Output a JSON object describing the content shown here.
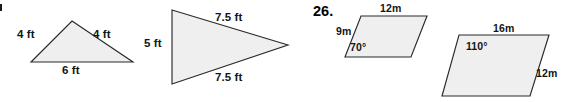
{
  "page": {
    "kind": "geometry-worksheet-excerpt",
    "width": 564,
    "height": 102,
    "background": "#ffffff",
    "shape_fill": "#efefef",
    "shape_stroke": "#2a2a2a"
  },
  "question_numbers": {
    "visible": "26.",
    "clipped_left_marker": ""
  },
  "figures": [
    {
      "id": "figure-1",
      "name": "isosceles-triangle",
      "type": "triangle",
      "units": "ft",
      "labels": {
        "left_side": "4 ft",
        "right_side": "4 ft",
        "base": "6 ft"
      },
      "points": "72,21 133,62 31,62"
    },
    {
      "id": "figure-2",
      "name": "wide-isosceles-triangle",
      "type": "triangle",
      "units": "ft",
      "labels": {
        "left_side": "5 ft",
        "upper_side": "7.5 ft",
        "lower_side": "7.5 ft"
      },
      "points": "172,10 288,45 172,84"
    },
    {
      "id": "figure-3",
      "name": "parallelogram-70-degree",
      "type": "parallelogram",
      "units": "m",
      "labels": {
        "top_side": "12m",
        "left_side": "9m",
        "interior_angle": "70°"
      },
      "points": "361,16 427,16 411,57 345,57"
    },
    {
      "id": "figure-4",
      "name": "parallelogram-110-degree",
      "type": "parallelogram",
      "units": "m",
      "labels": {
        "top_side": "16m",
        "right_side": "12m",
        "interior_angle": "110°"
      },
      "points": "459,35 549,35 530,96 442,96"
    }
  ]
}
